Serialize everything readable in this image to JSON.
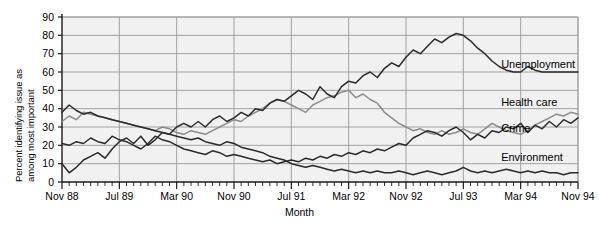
{
  "chart_data": {
    "type": "line",
    "title": "",
    "xlabel": "Month",
    "ylabel": "Percent identifying issue as among most important",
    "ylabel_lines": [
      "Percent identifying issue as",
      "among most important"
    ],
    "ylim": [
      0,
      90
    ],
    "ytick_step": 10,
    "yticks": [
      0,
      10,
      20,
      30,
      40,
      50,
      60,
      70,
      80,
      90
    ],
    "grid": true,
    "grid_axis": "y",
    "legend": "inline-right-labels",
    "x_major_labels": [
      "Nov 88",
      "Jul 89",
      "Mar 90",
      "Nov 90",
      "Jul 91",
      "Mar 92",
      "Nov 92",
      "Jul 93",
      "Mar 94",
      "Nov 94"
    ],
    "x_major_index": [
      0,
      8,
      16,
      24,
      32,
      40,
      48,
      56,
      64,
      72
    ],
    "x_minor_tick_interval_months": 1,
    "x_range_index": [
      0,
      72
    ],
    "x_start": "Nov 88",
    "x_end": "Nov 94",
    "series": [
      {
        "name": "Unemployment",
        "color": "#2b2b2b",
        "label_x_index": 61,
        "label_value": 64,
        "values": [
          10,
          5,
          8,
          12,
          14,
          16,
          13,
          18,
          22,
          24,
          21,
          25,
          20,
          23,
          27,
          26,
          30,
          32,
          30,
          33,
          30,
          34,
          36,
          33,
          35,
          38,
          36,
          40,
          39,
          43,
          45,
          44,
          47,
          50,
          48,
          45,
          52,
          48,
          46,
          52,
          55,
          54,
          58,
          60,
          57,
          62,
          65,
          63,
          68,
          72,
          70,
          74,
          78,
          76,
          79,
          81,
          80,
          77,
          73,
          70,
          66,
          63,
          61,
          60,
          60,
          63,
          61,
          60,
          60,
          60,
          60,
          60,
          60
        ]
      },
      {
        "name": "Health care",
        "color": "#8c8c8c",
        "label_x_index": 61,
        "label_value": 43,
        "values": [
          33,
          36,
          34,
          38,
          37,
          36,
          35,
          34,
          33,
          32,
          31,
          30,
          29,
          28,
          30,
          29,
          27,
          26,
          28,
          27,
          26,
          28,
          30,
          32,
          34,
          33,
          36,
          38,
          40,
          43,
          45,
          44,
          42,
          40,
          38,
          42,
          44,
          46,
          47,
          49,
          50,
          46,
          48,
          45,
          43,
          38,
          35,
          32,
          30,
          28,
          29,
          27,
          26,
          28,
          26,
          27,
          29,
          27,
          26,
          29,
          32,
          30,
          28,
          27,
          26,
          28,
          31,
          33,
          35,
          37,
          36,
          38,
          37
        ]
      },
      {
        "name": "Crime",
        "color": "#2b2b2b",
        "label_x_index": 61,
        "label_value": 29,
        "values": [
          21,
          20,
          22,
          21,
          24,
          22,
          21,
          25,
          23,
          22,
          20,
          18,
          21,
          25,
          23,
          22,
          20,
          18,
          17,
          16,
          15,
          17,
          16,
          14,
          15,
          14,
          13,
          12,
          11,
          12,
          10,
          11,
          12,
          11,
          13,
          12,
          14,
          13,
          15,
          14,
          16,
          15,
          17,
          16,
          18,
          17,
          19,
          21,
          20,
          24,
          26,
          28,
          27,
          25,
          28,
          30,
          27,
          23,
          26,
          24,
          28,
          27,
          30,
          29,
          32,
          27,
          31,
          29,
          33,
          30,
          34,
          32,
          35
        ]
      },
      {
        "name": "Environment",
        "color": "#2b2b2b",
        "label_x_index": 61,
        "label_value": 13,
        "values": [
          38,
          42,
          39,
          37,
          38,
          36,
          35,
          34,
          33,
          32,
          31,
          30,
          29,
          28,
          27,
          26,
          25,
          24,
          23,
          24,
          22,
          21,
          20,
          22,
          21,
          19,
          18,
          17,
          16,
          14,
          13,
          12,
          10,
          9,
          8,
          9,
          8,
          7,
          6,
          7,
          6,
          5,
          6,
          5,
          6,
          5,
          5,
          6,
          5,
          4,
          5,
          6,
          5,
          4,
          5,
          6,
          8,
          6,
          5,
          6,
          5,
          6,
          7,
          6,
          5,
          6,
          5,
          6,
          5,
          5,
          4,
          5,
          5
        ]
      }
    ]
  },
  "axes": {
    "y_tick_labels": [
      "90",
      "80",
      "70",
      "60",
      "50",
      "40",
      "30",
      "20",
      "10",
      "0"
    ],
    "x_tick_labels": [
      "Nov 88",
      "Jul 89",
      "Mar 90",
      "Nov 90",
      "Jul 91",
      "Mar 92",
      "Nov 92",
      "Jul 93",
      "Mar 94",
      "Nov 94"
    ],
    "x_title": "Month",
    "y_title_line1": "Percent identifying issue as",
    "y_title_line2": "among most important"
  },
  "series_labels": {
    "unemployment": "Unemployment",
    "health_care": "Health care",
    "crime": "Crime",
    "environment": "Environment"
  },
  "colors": {
    "plot_background": "#f1f1f1",
    "gridline": "#9a9a9a",
    "axis": "#1a1a1a",
    "dark_series": "#2b2b2b",
    "gray_series": "#8c8c8c",
    "page_background": "#ffffff"
  }
}
